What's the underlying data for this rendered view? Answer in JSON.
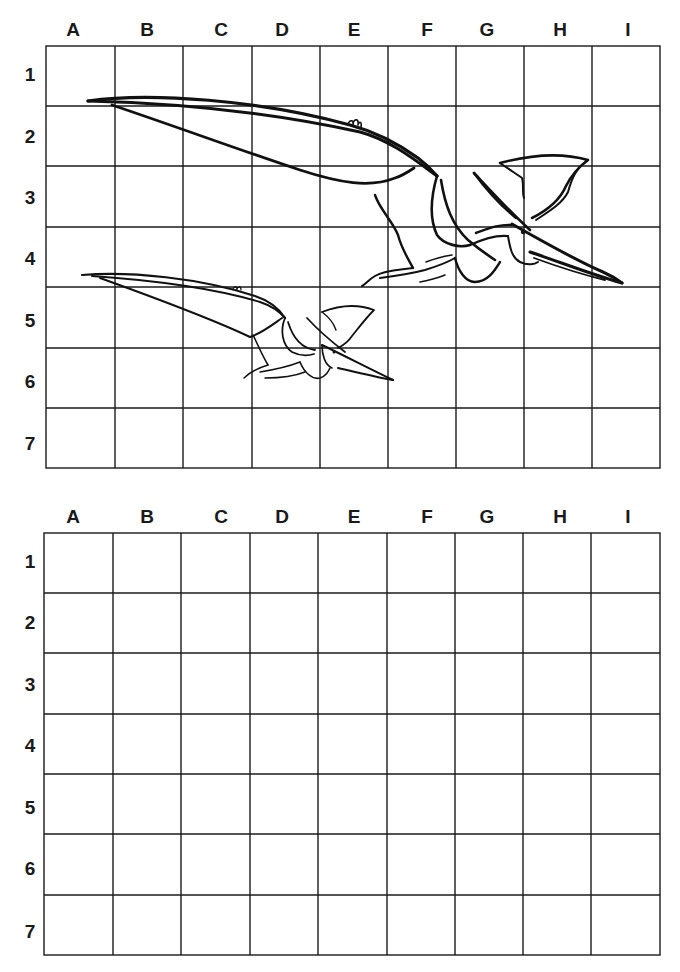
{
  "worksheet": {
    "columns": [
      "A",
      "B",
      "C",
      "D",
      "E",
      "F",
      "G",
      "H",
      "I"
    ],
    "rows": [
      "1",
      "2",
      "3",
      "4",
      "5",
      "6",
      "7"
    ],
    "grids": [
      {
        "name": "reference-grid",
        "contents": "Two pterodactyl line drawings (large one across rows 2-4, small one across rows 4-6)"
      },
      {
        "name": "blank-practice-grid",
        "contents": "empty"
      }
    ],
    "colors": {
      "line": "#1a1a1a",
      "background": "#ffffff"
    }
  }
}
